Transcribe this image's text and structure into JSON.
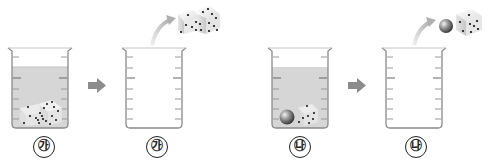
{
  "diagram": {
    "panels": [
      {
        "id": "ga-before",
        "label": "㉮",
        "state": "beaker with water and two dice submerged"
      },
      {
        "id": "ga-after",
        "label": "㉮",
        "state": "empty beaker, two dice lifted out"
      },
      {
        "id": "na-before",
        "label": "㉯",
        "state": "beaker with water, a metal ball and one die submerged"
      },
      {
        "id": "na-after",
        "label": "㉯",
        "state": "empty beaker, metal ball and die lifted out"
      }
    ],
    "arrows": [
      {
        "from": "ga-before",
        "to": "ga-after"
      },
      {
        "from": "na-before",
        "to": "na-after"
      }
    ],
    "colors": {
      "water": "#d4d4d4",
      "beaker_outline": "#8a8a8a",
      "arrow": "#8c8c8c",
      "die_face": "#eeeeee",
      "die_dot": "#111111",
      "ball": "#777777"
    }
  }
}
